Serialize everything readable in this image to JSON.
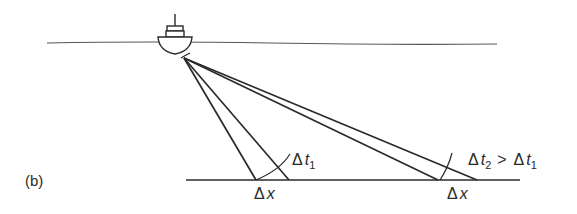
{
  "figure": {
    "panel_label": "(b)",
    "labels": {
      "delta_t1": {
        "delta": "Δ",
        "var": "t",
        "sub": "1"
      },
      "delta_t2_cmp": {
        "delta": "Δ",
        "var": "t",
        "sub": "2",
        "op": ">",
        "delta_b": "Δ",
        "var_b": "t",
        "sub_b": "1"
      },
      "delta_x_left": {
        "delta": "Δ",
        "var": "x"
      },
      "delta_x_right": {
        "delta": "Δ",
        "var": "x"
      }
    },
    "colors": {
      "line": "#2a2a2a",
      "sea": "#555555",
      "background": "#ffffff"
    }
  }
}
